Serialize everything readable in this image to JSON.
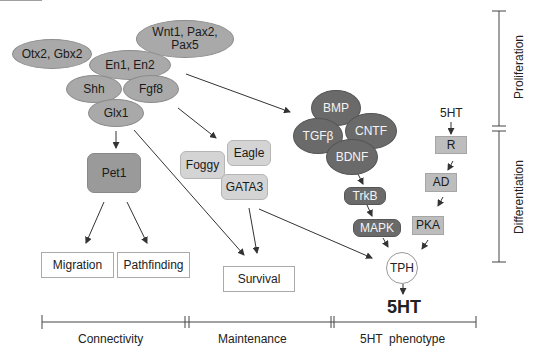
{
  "diagram": {
    "regulators": {
      "otx2_gbx2": "Otx2, Gbx2",
      "wnt1_pax2_pax5": "Wnt1, Pax2, Pax5",
      "en1_en2": "En1, En2",
      "shh": "Shh",
      "fgf8": "Fgf8",
      "glx1": "Glx1",
      "pet1": "Pet1",
      "foggy": "Foggy",
      "eagle": "Eagle",
      "gata3": "GATA3"
    },
    "factors": {
      "bmp": "BMP",
      "tgfb": "TGFβ",
      "cntf": "CNTF",
      "bdnf": "BDNF",
      "trkb": "TrkB",
      "mapk": "MAPK"
    },
    "receptor_path": {
      "input": "5HT",
      "r": "R",
      "ad": "AD",
      "pka": "PKA"
    },
    "tph": "TPH",
    "output": "5HT",
    "outcomes": {
      "migration": "Migration",
      "pathfinding": "Pathfinding",
      "survival": "Survival"
    },
    "timeline": {
      "connectivity": "Connectivity",
      "maintenance": "Maintenance",
      "phenotype": "5HT  phenotype"
    },
    "stages": {
      "proliferation": "Proliferation",
      "differentiation": "Differentiation"
    }
  }
}
